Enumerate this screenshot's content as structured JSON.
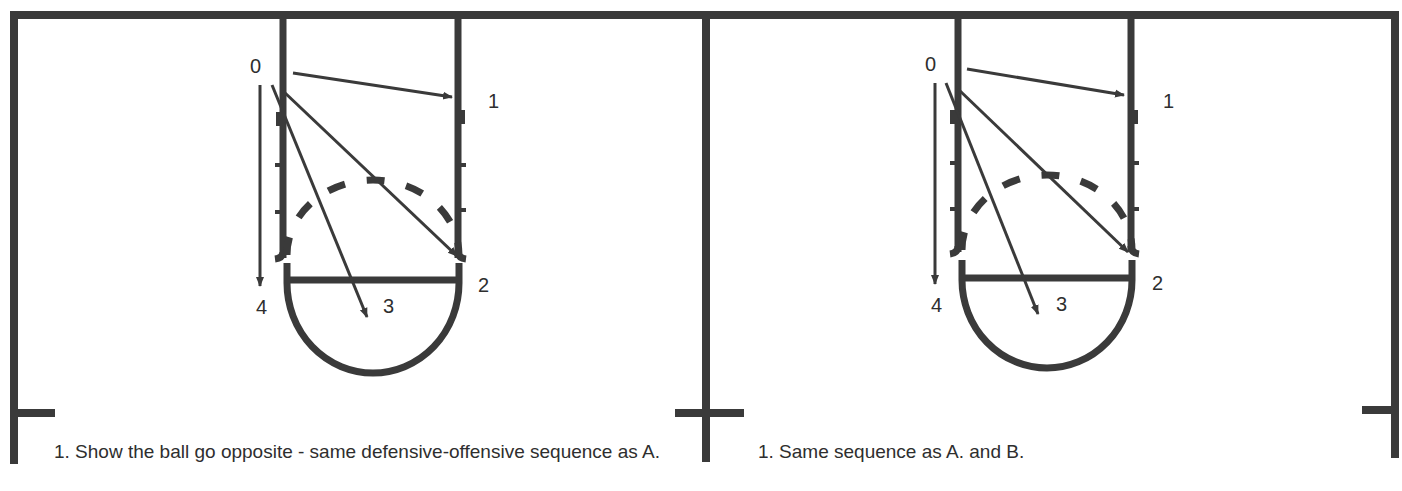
{
  "diagram": {
    "type": "basketball half-court play diagrams",
    "line_color": "#3a3a3a",
    "panels": [
      {
        "id": "left",
        "labels": [
          {
            "text": "0",
            "x": 258,
            "y": 73
          },
          {
            "text": "1",
            "x": 490,
            "y": 107
          },
          {
            "text": "2",
            "x": 481,
            "y": 292
          },
          {
            "text": "3",
            "x": 384,
            "y": 312
          },
          {
            "text": "4",
            "x": 258,
            "y": 314
          }
        ],
        "caption": "1. Show the ball go opposite - same defensive-offensive sequence as A."
      },
      {
        "id": "right",
        "labels": [
          {
            "text": "0",
            "x": 932,
            "y": 71
          },
          {
            "text": "1",
            "x": 1166,
            "y": 107
          },
          {
            "text": "2",
            "x": 1157,
            "y": 290
          },
          {
            "text": "3",
            "x": 1059,
            "y": 310
          },
          {
            "text": "4",
            "x": 936,
            "y": 312
          }
        ],
        "caption": "1. Same sequence as A. and B."
      }
    ]
  }
}
